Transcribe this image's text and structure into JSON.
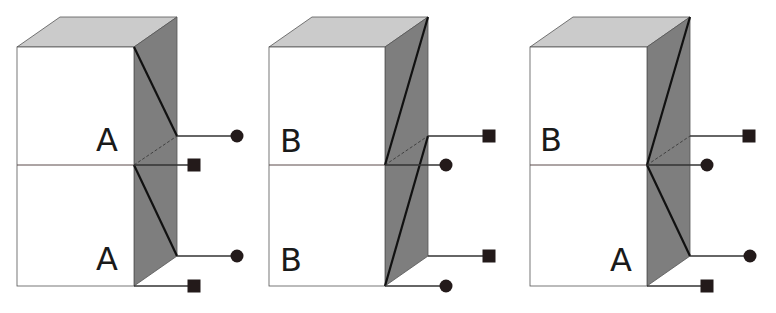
{
  "diagram": {
    "width": 776,
    "height": 313,
    "colors": {
      "background": "#ffffff",
      "front_face": "#ffffff",
      "top_face": "#cbcbcb",
      "side_face": "#7e7e7e",
      "edge": "#555555",
      "thick_line": "#111111",
      "connector_line": "#333333",
      "terminal": "#231a1a",
      "midline": "#5a4a4a"
    },
    "blocks": [
      {
        "id": "block-1",
        "front": {
          "x1": 17,
          "x2": 134,
          "y_top": 47,
          "y_mid": 165,
          "y_bot": 286
        },
        "depth": {
          "dx": 43,
          "dy": -30
        },
        "labels": [
          {
            "text": "A",
            "x": 96,
            "y": 151
          },
          {
            "text": "A",
            "x": 96,
            "y": 270
          }
        ],
        "thick_lines": [
          [
            [
              134,
              47
            ],
            [
              177,
              136
            ]
          ],
          [
            [
              134,
              165
            ],
            [
              177,
              256
            ]
          ]
        ],
        "dashed_lines": [
          [
            [
              134,
              165
            ],
            [
              177,
              136
            ]
          ]
        ],
        "terminals": [
          {
            "shape": "circle",
            "from": [
              177,
              136
            ],
            "x": 237,
            "y": 136
          },
          {
            "shape": "square",
            "from": [
              134,
              165
            ],
            "x": 194,
            "y": 165
          },
          {
            "shape": "circle",
            "from": [
              177,
              256
            ],
            "x": 237,
            "y": 256
          },
          {
            "shape": "square",
            "from": [
              134,
              286
            ],
            "x": 194,
            "y": 286
          }
        ]
      },
      {
        "id": "block-2",
        "front": {
          "x1": 269,
          "x2": 385,
          "y_top": 47,
          "y_mid": 165,
          "y_bot": 286
        },
        "depth": {
          "dx": 43,
          "dy": -30
        },
        "labels": [
          {
            "text": "B",
            "x": 280,
            "y": 152
          },
          {
            "text": "B",
            "x": 280,
            "y": 271
          }
        ],
        "thick_lines": [
          [
            [
              428,
              17
            ],
            [
              385,
              165
            ]
          ],
          [
            [
              428,
              136
            ],
            [
              385,
              286
            ]
          ]
        ],
        "dashed_lines": [
          [
            [
              385,
              165
            ],
            [
              428,
              136
            ]
          ]
        ],
        "terminals": [
          {
            "shape": "square",
            "from": [
              428,
              136
            ],
            "x": 489,
            "y": 136
          },
          {
            "shape": "circle",
            "from": [
              385,
              165
            ],
            "x": 446,
            "y": 165
          },
          {
            "shape": "square",
            "from": [
              428,
              256
            ],
            "x": 489,
            "y": 256
          },
          {
            "shape": "circle",
            "from": [
              385,
              286
            ],
            "x": 446,
            "y": 286
          }
        ]
      },
      {
        "id": "block-3",
        "front": {
          "x1": 530,
          "x2": 647,
          "y_top": 47,
          "y_mid": 165,
          "y_bot": 286
        },
        "depth": {
          "dx": 43,
          "dy": -30
        },
        "labels": [
          {
            "text": "B",
            "x": 540,
            "y": 151
          },
          {
            "text": "A",
            "x": 610,
            "y": 271
          }
        ],
        "thick_lines": [
          [
            [
              690,
              17
            ],
            [
              647,
              165
            ]
          ],
          [
            [
              647,
              165
            ],
            [
              690,
              256
            ]
          ]
        ],
        "dashed_lines": [
          [
            [
              647,
              165
            ],
            [
              690,
              136
            ]
          ]
        ],
        "terminals": [
          {
            "shape": "square",
            "from": [
              690,
              136
            ],
            "x": 749,
            "y": 136
          },
          {
            "shape": "circle",
            "from": [
              647,
              165
            ],
            "x": 707,
            "y": 165
          },
          {
            "shape": "circle",
            "from": [
              690,
              256
            ],
            "x": 750,
            "y": 256
          },
          {
            "shape": "square",
            "from": [
              647,
              286
            ],
            "x": 707,
            "y": 286
          }
        ]
      }
    ]
  }
}
